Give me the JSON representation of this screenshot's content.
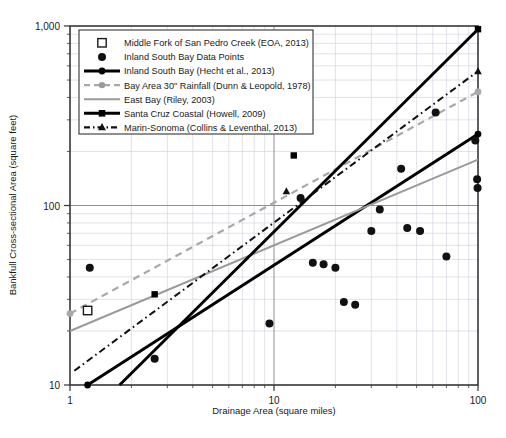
{
  "chart_data": {
    "type": "scatter",
    "title": "",
    "xlabel": "Drainage Area (square miles)",
    "ylabel": "Bankfull Cross-sectional Area (square feet)",
    "xscale": "log",
    "yscale": "log",
    "xlim": [
      1,
      100
    ],
    "ylim": [
      10,
      1000
    ],
    "xticks": [
      1,
      10,
      100
    ],
    "xticklabels": [
      "1",
      "10",
      "100"
    ],
    "yticks": [
      10,
      100,
      1000
    ],
    "yticklabels": [
      "10",
      "100",
      "1,000"
    ],
    "grid": "minor-log-both-axes",
    "legend_position": "upper-left-inside",
    "series": [
      {
        "name": "Middle Fork of San Pedro Creek (EOA, 2013)",
        "type": "scatter",
        "marker": "open-square",
        "color": "#1a1a1a",
        "points": [
          [
            1.22,
            26
          ]
        ]
      },
      {
        "name": "Inland South Bay Data Points",
        "type": "scatter",
        "marker": "filled-circle",
        "color": "#111111",
        "points": [
          [
            1.25,
            45
          ],
          [
            2.6,
            14
          ],
          [
            9.5,
            22
          ],
          [
            13.5,
            110
          ],
          [
            15.5,
            48
          ],
          [
            17.5,
            47
          ],
          [
            20.0,
            45
          ],
          [
            22.0,
            29
          ],
          [
            25.0,
            28
          ],
          [
            30.0,
            72
          ],
          [
            33.0,
            95
          ],
          [
            42.0,
            160
          ],
          [
            45.0,
            75
          ],
          [
            52.0,
            72
          ],
          [
            62.0,
            330
          ],
          [
            70.0,
            52
          ],
          [
            97.0,
            230
          ],
          [
            99.0,
            140
          ],
          [
            99.5,
            125
          ]
        ]
      },
      {
        "name": "Inland South Bay (Hecht et al., 2013)",
        "type": "line",
        "style": "solid-thick",
        "color": "#000000",
        "marker": "filled-circle-ends",
        "endpoints": [
          [
            1.22,
            10
          ],
          [
            100,
            250
          ]
        ]
      },
      {
        "name": "Bay Area 30\" Rainfall (Dunn & Leopold, 1978)",
        "type": "line",
        "style": "dashed",
        "color": "#a8a8a8",
        "marker": "filled-circle-ends",
        "endpoints": [
          [
            1.0,
            25
          ],
          [
            100,
            430
          ]
        ]
      },
      {
        "name": "East Bay (Riley, 2003)",
        "type": "line",
        "style": "solid-thin",
        "color": "#9a9a9a",
        "endpoints": [
          [
            1.0,
            20
          ],
          [
            100,
            180
          ]
        ]
      },
      {
        "name": "Santa Cruz Coastal (Howell, 2009)",
        "type": "line",
        "style": "solid-thick",
        "color": "#000000",
        "marker": "filled-square",
        "endpoints": [
          [
            1.75,
            10
          ],
          [
            100,
            960
          ]
        ],
        "markers_at": [
          [
            2.6,
            32
          ],
          [
            12.5,
            190
          ]
        ]
      },
      {
        "name": "Marin-Sonoma (Collins & Leventhal, 2013)",
        "type": "line",
        "style": "dash-dot",
        "color": "#111111",
        "marker": "filled-triangle",
        "endpoints": [
          [
            1.05,
            12
          ],
          [
            100,
            560
          ]
        ],
        "markers_at": [
          [
            11.5,
            120
          ]
        ]
      }
    ]
  },
  "legend": {
    "items": [
      {
        "label": "Middle Fork of San Pedro Creek (EOA, 2013)",
        "glyph": "open-square"
      },
      {
        "label": "Inland South Bay Data Points",
        "glyph": "filled-circle"
      },
      {
        "label": "Inland South Bay (Hecht et al., 2013)",
        "glyph": "thick-line-circle"
      },
      {
        "label": "Bay Area 30\" Rainfall (Dunn & Leopold, 1978)",
        "glyph": "gray-dashed-circle"
      },
      {
        "label": "East Bay (Riley, 2003)",
        "glyph": "gray-line"
      },
      {
        "label": "Santa Cruz Coastal (Howell, 2009)",
        "glyph": "thick-line-square"
      },
      {
        "label": "Marin-Sonoma (Collins & Leventhal, 2013)",
        "glyph": "dashdot-triangle"
      }
    ]
  },
  "axes": {
    "x_title": "Drainage Area (square miles)",
    "y_title": "Bankfull Cross-sectional Area (square feet)",
    "x_tick_labels": [
      "1",
      "10",
      "100"
    ],
    "y_tick_labels": [
      "1,000",
      "100",
      "10"
    ]
  },
  "colors": {
    "plot_frame": "#333333",
    "grid_minor": "#d6d6e0",
    "grid_major": "#8f8f9a",
    "black_line": "#000000",
    "gray_line": "#9a9a9a",
    "gray_dash": "#a8a8a8"
  }
}
